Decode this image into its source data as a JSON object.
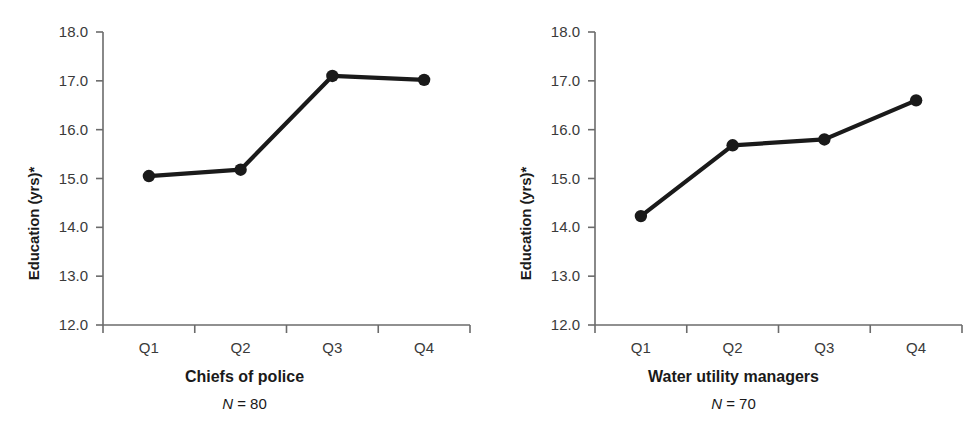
{
  "figure": {
    "width": 978,
    "height": 447,
    "background": "#ffffff",
    "line_color": "#1a1a1a",
    "axis_color": "#6b6b6b",
    "tick_text_color": "#3a3a3a"
  },
  "panels": [
    {
      "id": "chiefs-of-police",
      "caption": "Chiefs of police",
      "n_label": "N = 70",
      "n_prefix": "N",
      "n_value": "= 80",
      "ylabel": "Education (yrs)*"
    },
    {
      "id": "water-utility-managers",
      "caption": "Water utility managers",
      "n_prefix": "N",
      "n_value": "= 70",
      "ylabel": "Education (yrs)*"
    }
  ],
  "chart_data": [
    {
      "type": "line",
      "title": "Chiefs of police",
      "subtitle": "N = 80",
      "xlabel": "",
      "ylabel": "Education (yrs)*",
      "categories": [
        "Q1",
        "Q2",
        "Q3",
        "Q4"
      ],
      "values": [
        15.05,
        15.18,
        17.1,
        17.02
      ],
      "ylim": [
        12.0,
        18.0
      ],
      "ytick_labels": [
        "18.0",
        "17.0",
        "16.0",
        "15.0",
        "14.0",
        "13.0",
        "12.0"
      ],
      "yticks": [
        18.0,
        17.0,
        16.0,
        15.0,
        14.0,
        13.0,
        12.0
      ],
      "grid": false,
      "legend": "none",
      "marker": "filled-circle",
      "n": 80
    },
    {
      "type": "line",
      "title": "Water utility managers",
      "subtitle": "N = 70",
      "xlabel": "",
      "ylabel": "Education (yrs)*",
      "categories": [
        "Q1",
        "Q2",
        "Q3",
        "Q4"
      ],
      "values": [
        14.23,
        15.68,
        15.8,
        16.6
      ],
      "ylim": [
        12.0,
        18.0
      ],
      "ytick_labels": [
        "18.0",
        "17.0",
        "16.0",
        "15.0",
        "14.0",
        "13.0",
        "12.0"
      ],
      "yticks": [
        18.0,
        17.0,
        16.0,
        15.0,
        14.0,
        13.0,
        12.0
      ],
      "grid": false,
      "legend": "none",
      "marker": "filled-circle",
      "n": 70
    }
  ]
}
